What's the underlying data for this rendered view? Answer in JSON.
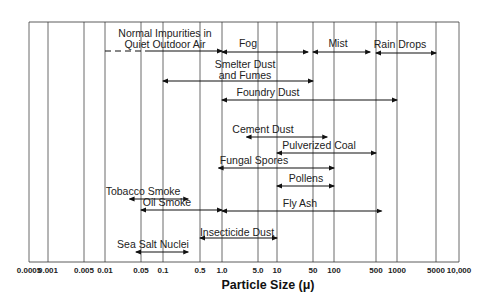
{
  "chart_data": {
    "type": "range-bar",
    "title": "",
    "xlabel": "Particle  Size (μ)",
    "ylabel": "",
    "x_scale": "log",
    "xlim": [
      0.0005,
      10000
    ],
    "grid": "vertical gridlines at each tick",
    "legend": "none",
    "ticks": [
      "0.0005",
      "0.001",
      "0.005",
      "0.01",
      "0.05",
      "0.1",
      "0.5",
      "1.0",
      "5.0",
      "10",
      "50",
      "100",
      "500",
      "1000",
      "5000",
      "10,000"
    ],
    "tick_values": [
      0.0005,
      0.001,
      0.005,
      0.01,
      0.05,
      0.1,
      0.5,
      1,
      5,
      10,
      50,
      100,
      500,
      1000,
      5000,
      10000
    ],
    "series": [
      {
        "name": "Normal Impurities in Quiet Outdoor Air",
        "min": 0.01,
        "max": 1.0,
        "dashed_start_to": 0.05,
        "label_lines": [
          "Normal Impurities in",
          "Quiet Outdoor Air"
        ]
      },
      {
        "name": "Fog",
        "min": 1.0,
        "max": 40,
        "label_lines": [
          "Fog"
        ]
      },
      {
        "name": "Mist",
        "min": 50,
        "max": 400,
        "label_lines": [
          "Mist"
        ]
      },
      {
        "name": "Rain Drops",
        "min": 500,
        "max": 5000,
        "label_lines": [
          "Rain Drops"
        ]
      },
      {
        "name": "Smelter Dust and Fumes",
        "min": 0.1,
        "max": 50,
        "label_lines": [
          "Smelter Dust",
          "and Fumes"
        ]
      },
      {
        "name": "Foundry Dust",
        "min": 1.0,
        "max": 1000,
        "label_lines": [
          "Foundry Dust"
        ]
      },
      {
        "name": "Cement Dust",
        "min": 3,
        "max": 80,
        "label_lines": [
          "Cement Dust"
        ]
      },
      {
        "name": "Pulverized Coal",
        "min": 10,
        "max": 500,
        "label_lines": [
          "Pulverized Coal"
        ]
      },
      {
        "name": "Fungal Spores",
        "min": 0.9,
        "max": 100,
        "label_lines": [
          "Fungal Spores"
        ]
      },
      {
        "name": "Pollens",
        "min": 10,
        "max": 100,
        "label_lines": [
          "Pollens"
        ]
      },
      {
        "name": "Tobacco Smoke",
        "min": 0.03,
        "max": 0.3,
        "label_lines": [
          "Tobacco Smoke"
        ]
      },
      {
        "name": "Oil Smoke",
        "min": 0.05,
        "max": 1.0,
        "label_lines": [
          "Oil Smoke"
        ]
      },
      {
        "name": "Fly Ash",
        "min": 1.0,
        "max": 600,
        "label_lines": [
          "Fly Ash"
        ]
      },
      {
        "name": "Insecticide Dust",
        "min": 0.5,
        "max": 10,
        "label_lines": [
          "Insecticide Dust"
        ]
      },
      {
        "name": "Sea Salt Nuclei",
        "min": 0.04,
        "max": 0.3,
        "label_lines": [
          "Sea Salt Nuclei"
        ]
      }
    ]
  }
}
